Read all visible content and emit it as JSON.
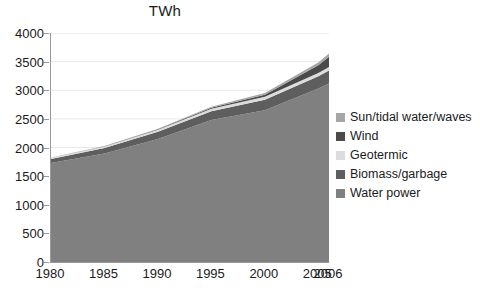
{
  "chart_data": {
    "type": "area",
    "title": "TWh",
    "xlabel": "",
    "ylabel": "",
    "stacked": true,
    "grid": true,
    "legend_position": "right",
    "x": [
      1980,
      1985,
      1990,
      1995,
      2000,
      2005,
      2006
    ],
    "xtick_labels": [
      "1980",
      "1985",
      "1990",
      "1995",
      "2000",
      "2005",
      "2006"
    ],
    "ytick_labels": [
      "0",
      "500",
      "1000",
      "1500",
      "2000",
      "2500",
      "3000",
      "3500",
      "4000"
    ],
    "yticks": [
      0,
      500,
      1000,
      1500,
      2000,
      2500,
      3000,
      3500,
      4000
    ],
    "ylim": [
      0,
      4000
    ],
    "xlim": [
      1980,
      2006
    ],
    "series": [
      {
        "name": "Water power",
        "color": "#808080",
        "values": [
          1730,
          1895,
          2150,
          2480,
          2650,
          3030,
          3120
        ]
      },
      {
        "name": "Biomass/garbage",
        "color": "#5e5e5e",
        "values": [
          70,
          95,
          125,
          155,
          185,
          215,
          225
        ]
      },
      {
        "name": "Geotermic",
        "color": "#dcdcdc",
        "values": [
          20,
          28,
          36,
          44,
          52,
          58,
          60
        ]
      },
      {
        "name": "Wind",
        "color": "#4a4a4a",
        "values": [
          0,
          2,
          6,
          14,
          35,
          135,
          180
        ]
      },
      {
        "name": "Sun/tidal water/waves",
        "color": "#a6a6a6",
        "values": [
          5,
          8,
          12,
          18,
          28,
          45,
          55
        ]
      }
    ],
    "totals": [
      1825,
      2028,
      2329,
      2711,
      2950,
      3483,
      3640
    ]
  },
  "legend": {
    "items": [
      {
        "label": "Sun/tidal water/waves",
        "color": "#a6a6a6"
      },
      {
        "label": "Wind",
        "color": "#4a4a4a"
      },
      {
        "label": "Geotermic",
        "color": "#dcdcdc"
      },
      {
        "label": "Biomass/garbage",
        "color": "#5e5e5e"
      },
      {
        "label": "Water power",
        "color": "#808080"
      }
    ]
  },
  "style": {
    "axis_color": "#9a9a9a",
    "grid_color": "#e8e8e8",
    "text_color": "#1a1a1a",
    "plot_background": "#ffffff",
    "page_background": "#ffffff"
  }
}
